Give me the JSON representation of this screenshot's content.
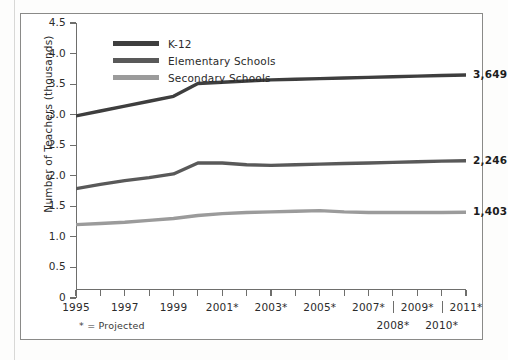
{
  "figure": {
    "footnote": "* = Projected"
  },
  "chart_data": {
    "type": "line",
    "title": "",
    "xlabel": "",
    "ylabel": "Number of Teachers (thousands)",
    "ylim": [
      0,
      4.5
    ],
    "ytick_labels": [
      "0",
      "0.5",
      "1.0",
      "1.5",
      "2.0",
      "2.5",
      "3.0",
      "3.5",
      "4.0",
      "4.5"
    ],
    "ytick_values": [
      0,
      0.5,
      1.0,
      1.5,
      2.0,
      2.5,
      3.0,
      3.5,
      4.0,
      4.5
    ],
    "grid": false,
    "legend_position": "top-left",
    "x": [
      1995,
      1996,
      1997,
      1998,
      1999,
      2000,
      2001,
      2002,
      2003,
      2004,
      2005,
      2006,
      2007,
      2008,
      2009,
      2010,
      2011
    ],
    "xtick_labels": [
      "1995",
      "1997",
      "1999",
      "2001*",
      "2003*",
      "2005*",
      "2007*",
      "2009*",
      "2011*"
    ],
    "xtick_label_years": [
      1995,
      1997,
      1999,
      2001,
      2003,
      2005,
      2007,
      2009,
      2011
    ],
    "xtick_labels_row2": [
      "2008*",
      "2010*"
    ],
    "xtick_label_row2_years": [
      2008,
      2010
    ],
    "xtick_all_years": [
      1995,
      1996,
      1997,
      1998,
      1999,
      2000,
      2001,
      2002,
      2003,
      2004,
      2005,
      2006,
      2007,
      2008,
      2009,
      2010,
      2011
    ],
    "xsep_years": [
      2008,
      2010
    ],
    "series": [
      {
        "name": "K-12",
        "color": "#3e3e3e",
        "end_label": "3,649",
        "values": [
          2.98,
          3.06,
          3.14,
          3.22,
          3.3,
          3.51,
          3.53,
          3.55,
          3.57,
          3.58,
          3.59,
          3.6,
          3.61,
          3.62,
          3.63,
          3.64,
          3.649
        ]
      },
      {
        "name": "Elementary Schools",
        "color": "#595959",
        "end_label": "2,246",
        "values": [
          1.79,
          1.86,
          1.92,
          1.97,
          2.03,
          2.21,
          2.21,
          2.18,
          2.17,
          2.18,
          2.19,
          2.2,
          2.21,
          2.22,
          2.23,
          2.24,
          2.246
        ]
      },
      {
        "name": "Secondary Schools",
        "color": "#9b9b9b",
        "end_label": "1,403",
        "values": [
          1.2,
          1.22,
          1.24,
          1.27,
          1.3,
          1.35,
          1.38,
          1.4,
          1.41,
          1.42,
          1.43,
          1.41,
          1.4,
          1.4,
          1.4,
          1.4,
          1.403
        ]
      }
    ]
  }
}
